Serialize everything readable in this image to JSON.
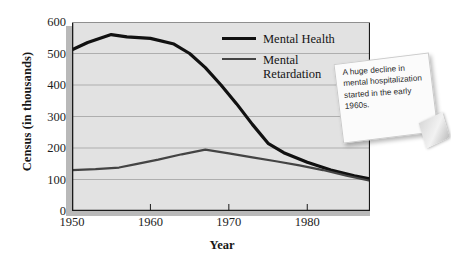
{
  "chart_data": {
    "type": "line",
    "title": "",
    "xlabel": "Year",
    "ylabel": "Census (in thousands)",
    "xlim": [
      1950,
      1988
    ],
    "ylim": [
      0,
      600
    ],
    "grid": true,
    "grid_axis": "y",
    "legend_position": "top-right-inside",
    "x_ticks": [
      1950,
      1960,
      1970,
      1980
    ],
    "y_ticks": [
      0,
      100,
      200,
      300,
      400,
      500,
      600
    ],
    "series": [
      {
        "name": "Mental Health",
        "color": "#111111",
        "width": 3.2,
        "x": [
          1950,
          1952,
          1955,
          1957,
          1960,
          1963,
          1965,
          1967,
          1969,
          1971,
          1973,
          1975,
          1977,
          1980,
          1983,
          1986,
          1988
        ],
        "values": [
          512,
          535,
          560,
          553,
          548,
          530,
          500,
          455,
          400,
          340,
          275,
          215,
          185,
          155,
          130,
          112,
          102
        ]
      },
      {
        "name": "Mental Retardation",
        "color": "#444444",
        "width": 2.2,
        "x": [
          1950,
          1953,
          1956,
          1958,
          1961,
          1964,
          1967,
          1970,
          1973,
          1976,
          1979,
          1982,
          1985,
          1988
        ],
        "values": [
          130,
          133,
          138,
          148,
          163,
          180,
          195,
          183,
          170,
          158,
          145,
          130,
          112,
          96
        ]
      }
    ],
    "annotations": [
      {
        "name": "sticky-note",
        "text": "A huge decline in mental hospitalization started in the early 1960s."
      }
    ]
  },
  "axes": {
    "y_title": "Census (in thousands)",
    "x_title": "Year",
    "y_tick_labels": [
      "600",
      "500",
      "400",
      "300",
      "200",
      "100",
      "0"
    ],
    "x_tick_labels": [
      "1950",
      "1960",
      "1970",
      "1980"
    ]
  },
  "legend": {
    "items": [
      {
        "label": "Mental Health"
      },
      {
        "label": "Mental\nRetardation"
      }
    ]
  },
  "note": {
    "text": "A huge decline in mental hospitalization started in the early 1960s."
  },
  "colors": {
    "panel_background": "#e2e2e2",
    "panel_shadow": "#b9b9b9",
    "gridline": "#aeaeae",
    "axis_line": "#1a1a1a",
    "series_primary": "#111111",
    "series_secondary": "#444444",
    "page_background": "#ffffff"
  }
}
